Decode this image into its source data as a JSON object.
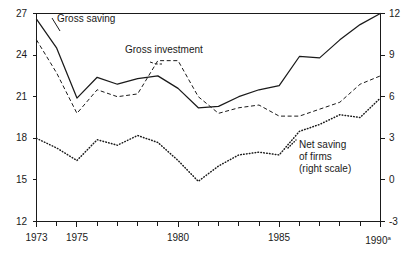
{
  "chart_data": {
    "type": "line",
    "title": "",
    "subtitle": "",
    "xlabel": "",
    "ylabel": "",
    "y2label": "",
    "grid": false,
    "legend_position": "inline-annotations",
    "x": [
      1973,
      1974,
      1975,
      1976,
      1977,
      1978,
      1979,
      1980,
      1981,
      1982,
      1983,
      1984,
      1985,
      1986,
      1987,
      1988,
      1989,
      1990
    ],
    "x_tick_labels": [
      "1973",
      "",
      "1975",
      "",
      "",
      "",
      "",
      "1980",
      "",
      "",
      "",
      "",
      "1985",
      "",
      "",
      "",
      "",
      "1990ᵃ"
    ],
    "xlim": [
      1973,
      1990
    ],
    "ylim": [
      12,
      27
    ],
    "y_ticks": [
      12,
      15,
      18,
      21,
      24,
      27
    ],
    "y_tick_labels": [
      "12",
      "15",
      "18",
      "21",
      "24",
      "27"
    ],
    "y2lim": [
      -3,
      12
    ],
    "y2_ticks": [
      -3,
      0,
      3,
      6,
      9,
      12
    ],
    "y2_tick_labels": [
      "-3",
      "0",
      "3",
      "6",
      "9",
      "12"
    ],
    "series": [
      {
        "name": "Gross saving",
        "axis": "left",
        "style": "solid",
        "values": [
          26.6,
          24.5,
          20.9,
          22.4,
          21.9,
          22.3,
          22.5,
          21.6,
          20.2,
          20.3,
          21.0,
          21.5,
          21.8,
          23.9,
          23.8,
          25.1,
          26.2,
          27.0
        ]
      },
      {
        "name": "Gross investment",
        "axis": "left",
        "style": "dashed",
        "values": [
          25.1,
          22.7,
          19.8,
          21.5,
          21.0,
          21.2,
          23.6,
          23.6,
          21.0,
          19.8,
          20.2,
          20.4,
          19.6,
          19.6,
          20.1,
          20.6,
          21.9,
          22.5
        ]
      },
      {
        "name": "Net saving of firms",
        "axis": "right",
        "style": "dotted",
        "values": [
          3.0,
          2.3,
          1.4,
          2.9,
          2.5,
          3.2,
          2.7,
          1.4,
          -0.1,
          1.0,
          1.8,
          2.0,
          1.8,
          3.5,
          4.0,
          4.7,
          4.5,
          5.9
        ]
      }
    ],
    "annotations": [
      {
        "name": "gross-saving-label",
        "text": "Gross saving"
      },
      {
        "name": "gross-investment-label",
        "text": "Gross investment"
      },
      {
        "name": "net-saving-label-line1",
        "text": "Net saving"
      },
      {
        "name": "net-saving-label-line2",
        "text": "of firms"
      },
      {
        "name": "net-saving-label-line3",
        "text": "(right scale)"
      }
    ]
  },
  "axes": {
    "left_labels": [
      "27",
      "24",
      "21",
      "18",
      "15",
      "12"
    ],
    "right_labels": [
      "12",
      "9",
      "6",
      "3",
      "0",
      "-3"
    ],
    "x_labels": [
      "1973",
      "1975",
      "1980",
      "1985",
      "1990"
    ],
    "x_last_superscript": "a"
  },
  "labels": {
    "gross_saving": "Gross saving",
    "gross_investment": "Gross investment",
    "net_saving_1": "Net saving",
    "net_saving_2": "of firms",
    "net_saving_3": "(right scale)"
  },
  "colors": {
    "ink": "#1a1a1a",
    "background": "#ffffff"
  }
}
